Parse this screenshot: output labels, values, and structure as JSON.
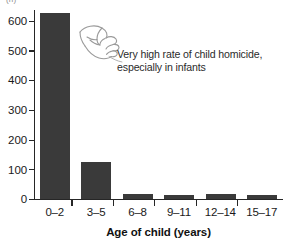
{
  "chart_data": {
    "type": "bar",
    "title": "",
    "subtitle": "",
    "xlabel": "Age of child (years)",
    "ylabel": "",
    "ylabel_clipped": "(n)",
    "categories": [
      "0–2",
      "3–5",
      "6–8",
      "9–11",
      "12–14",
      "15–17"
    ],
    "values": [
      637,
      125,
      16,
      15,
      16,
      13
    ],
    "ylim": [
      0,
      650
    ],
    "yticks": [
      0,
      100,
      200,
      300,
      400,
      500,
      600
    ],
    "ytick_labels": [
      "0",
      "100",
      "200",
      "300",
      "400",
      "500",
      "600"
    ],
    "grid": false,
    "legend": null,
    "bar_color": "#3a3a3a",
    "axis_color": "#262626",
    "background": "#ffffff",
    "annotations": [
      {
        "id": "high-rate-note",
        "line1": "Very high rate of child homicide,",
        "line2": "especially in infants",
        "icon": "pointing-hand-icon",
        "points_to_category": "0–2"
      }
    ]
  }
}
